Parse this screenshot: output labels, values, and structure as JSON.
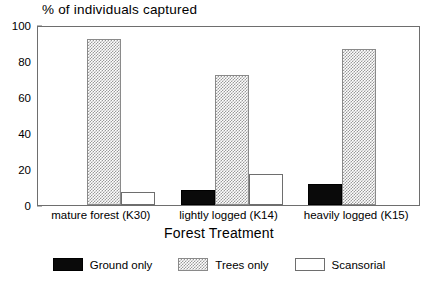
{
  "chart_data": {
    "type": "bar",
    "title": "% of individuals captured",
    "xlabel": "Forest Treatment",
    "ylabel": "",
    "ylim": [
      0,
      100
    ],
    "yticks": [
      0,
      20,
      40,
      60,
      80,
      100
    ],
    "grid": false,
    "legend_position": "bottom",
    "categories": [
      "mature forest (K30)",
      "lightly logged (K14)",
      "heavily logged (K15)"
    ],
    "series": [
      {
        "name": "Ground only",
        "color": "#0a0a0a",
        "values": [
          0,
          8.5,
          11.5
        ]
      },
      {
        "name": "Trees only",
        "color": "#9a9a9a",
        "values": [
          92.5,
          72,
          86.5
        ]
      },
      {
        "name": "Scansorial",
        "color": "#ffffff",
        "values": [
          7,
          17.5,
          0
        ]
      }
    ]
  }
}
